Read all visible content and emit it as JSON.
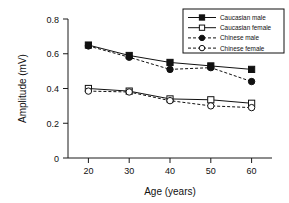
{
  "chart_data": {
    "type": "line",
    "title": "",
    "xlabel": "Age (years)",
    "ylabel": "Amplitude (mV)",
    "x": [
      20,
      30,
      40,
      50,
      60
    ],
    "xticklabels": [
      "20",
      "30",
      "40",
      "50",
      "60"
    ],
    "yticklabels": [
      "0",
      "0.2",
      "0.4",
      "0.6",
      "0.8"
    ],
    "yticks": [
      0,
      0.2,
      0.4,
      0.6,
      0.8
    ],
    "xlim": [
      15,
      65
    ],
    "ylim": [
      0,
      0.8
    ],
    "grid": false,
    "legend_position": "top-right",
    "series": [
      {
        "name": "Caucasian male",
        "values": [
          0.65,
          0.59,
          0.55,
          0.53,
          0.51
        ],
        "marker": "filled-square",
        "linestyle": "solid",
        "color": "#111111"
      },
      {
        "name": "Caucasian female",
        "values": [
          0.4,
          0.385,
          0.34,
          0.335,
          0.315
        ],
        "marker": "open-square",
        "linestyle": "solid",
        "color": "#111111"
      },
      {
        "name": "Chinese male",
        "values": [
          0.645,
          0.58,
          0.51,
          0.52,
          0.44
        ],
        "marker": "filled-circle",
        "linestyle": "dashed",
        "color": "#111111"
      },
      {
        "name": "Chinese female",
        "values": [
          0.385,
          0.38,
          0.33,
          0.3,
          0.29
        ],
        "marker": "open-circle",
        "linestyle": "dashed",
        "color": "#111111"
      }
    ]
  },
  "legend": {
    "entries": [
      {
        "label": "Caucasian male"
      },
      {
        "label": "Caucasian female"
      },
      {
        "label": "Chinese male"
      },
      {
        "label": "Chinese female"
      }
    ]
  }
}
